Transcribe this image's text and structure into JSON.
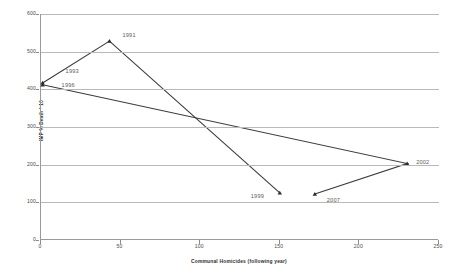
{
  "chart_data": {
    "type": "line",
    "title": "",
    "xlabel": "Communal Homicides (following year)",
    "ylabel": "IMP % Death * 10",
    "xlim": [
      0,
      250
    ],
    "ylim": [
      0,
      600
    ],
    "xticks": [
      0,
      50,
      100,
      150,
      200,
      250
    ],
    "yticks": [
      0,
      100,
      200,
      300,
      400,
      500,
      600
    ],
    "grid": true,
    "legend": "none",
    "series": [
      {
        "name": "path-a",
        "points": [
          {
            "label": "1993",
            "x": 1,
            "y": 417
          },
          {
            "label": "1991",
            "x": 43,
            "y": 528
          },
          {
            "label": "1999",
            "x": 150,
            "y": 125
          }
        ]
      },
      {
        "name": "path-b",
        "points": [
          {
            "label": "1996",
            "x": 1,
            "y": 412
          },
          {
            "label": "2002",
            "x": 230,
            "y": 203
          },
          {
            "label": "2007",
            "x": 172,
            "y": 122
          }
        ]
      }
    ],
    "point_labels": [
      {
        "text": "1991",
        "x": 43,
        "y": 528,
        "dx": 14,
        "dy": -5
      },
      {
        "text": "1993",
        "x": 1,
        "y": 417,
        "dx": 24,
        "dy": -11
      },
      {
        "text": "1996",
        "x": 1,
        "y": 412,
        "dx": 20,
        "dy": 1
      },
      {
        "text": "1999",
        "x": 150,
        "y": 125,
        "dx": -28,
        "dy": 4
      },
      {
        "text": "2002",
        "x": 230,
        "y": 203,
        "dx": 10,
        "dy": -1
      },
      {
        "text": "2007",
        "x": 172,
        "y": 122,
        "dx": 13,
        "dy": 7
      }
    ],
    "colors": {
      "line": "#3b3b3b",
      "marker": "#2b2b2b",
      "grid": "#b9b9b9",
      "axis": "#9a9a9a",
      "label": "#5a5a5a"
    }
  }
}
